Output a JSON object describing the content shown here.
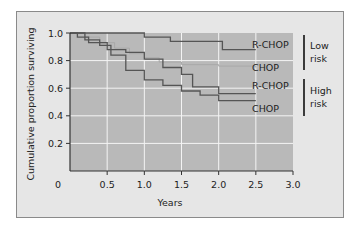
{
  "chart_data": {
    "type": "line",
    "subtype": "kaplan-meier step curves",
    "title": "",
    "xlabel": "Years",
    "ylabel": "Cumulative proportion surviving",
    "xlim": [
      0,
      3.0
    ],
    "ylim": [
      0,
      1.0
    ],
    "x_ticks": [
      "0",
      "0.5",
      "1.0",
      "1.5",
      "2.0",
      "2.5",
      "3.0"
    ],
    "y_ticks": [
      "0.2",
      "0.4",
      "0.6",
      "0.8",
      "1.0"
    ],
    "grid": true,
    "legend_position": "right, inline labels",
    "series": [
      {
        "name": "R-CHOP",
        "group": "Low risk",
        "color": "#555555",
        "x": [
          0,
          0.95,
          1.0,
          1.3,
          1.35,
          2.0,
          2.05,
          2.5
        ],
        "values": [
          1.0,
          1.0,
          0.97,
          0.97,
          0.94,
          0.94,
          0.88,
          0.88
        ]
      },
      {
        "name": "CHOP",
        "group": "Low risk",
        "color": "#a8a8a8",
        "x": [
          0,
          0.2,
          0.4,
          0.6,
          0.8,
          1.0,
          1.2,
          1.5,
          2.0,
          2.5
        ],
        "values": [
          1.0,
          0.97,
          0.93,
          0.89,
          0.85,
          0.82,
          0.79,
          0.77,
          0.76,
          0.75
        ]
      },
      {
        "name": "R-CHOP",
        "group": "High risk",
        "color": "#555555",
        "x": [
          0,
          0.1,
          0.25,
          0.5,
          0.75,
          1.0,
          1.25,
          1.5,
          1.65,
          2.0,
          2.5
        ],
        "values": [
          1.0,
          0.97,
          0.93,
          0.88,
          0.86,
          0.81,
          0.75,
          0.7,
          0.61,
          0.56,
          0.56
        ]
      },
      {
        "name": "CHOP",
        "group": "High risk",
        "color": "#555555",
        "x": [
          0,
          0.2,
          0.4,
          0.55,
          0.75,
          1.0,
          1.25,
          1.5,
          1.75,
          2.0,
          2.5
        ],
        "values": [
          1.0,
          0.95,
          0.91,
          0.84,
          0.73,
          0.66,
          0.62,
          0.58,
          0.55,
          0.51,
          0.51
        ]
      }
    ],
    "annotations": [
      {
        "text": "Low risk",
        "applies_to": [
          "R-CHOP",
          "CHOP"
        ]
      },
      {
        "text": "High risk",
        "applies_to": [
          "R-CHOP",
          "CHOP"
        ]
      }
    ]
  },
  "labels": {
    "x_axis_title": "Years",
    "y_axis_title": "Cumulative proportion surviving",
    "x_ticks": [
      "0",
      "0.5",
      "1.0",
      "1.5",
      "2.0",
      "2.5",
      "3.0"
    ],
    "y_ticks": [
      "1.0",
      "0.8",
      "0.6",
      "0.4",
      "0.2"
    ],
    "series_labels": [
      "R-CHOP",
      "CHOP",
      "R-CHOP",
      "CHOP"
    ],
    "group_low_line1": "Low",
    "group_low_line2": "risk",
    "group_high_line1": "High",
    "group_high_line2": "risk"
  },
  "colors": {
    "panel_bg": "#e6e6e6",
    "plot_bg": "#b9b9b9",
    "grid": "#f4f4f4",
    "curve_dark": "#555555",
    "curve_light": "#a8a8a8",
    "axis": "#333333"
  }
}
